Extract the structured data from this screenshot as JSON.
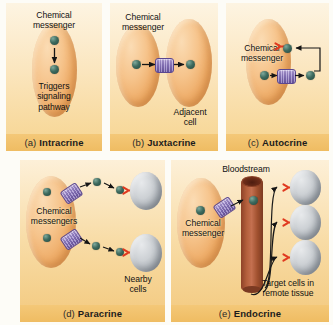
{
  "figure": {
    "colors": {
      "panel_bg_light": "#fdf4e2",
      "panel_bg_amber": "#f6d48f",
      "caption_band": "#f4c878",
      "cell_fill": "#f0b071",
      "target_cell_fill": "#b9bfc5",
      "messenger_dot": "#3e6b5f",
      "channel_purple": "#8e79c4",
      "receptor_red": "#e03a20",
      "vessel_red_brown": "#a1512f",
      "arrow_black": "#1a1a1a"
    }
  },
  "panels": [
    {
      "id": "intracrine",
      "letter": "(a)",
      "name": "Intracrine",
      "labels": {
        "messenger": "Chemical\nmessenger",
        "effect": "Triggers\nsignaling\npathway"
      },
      "elements": {
        "cells": 1,
        "messenger_dots": 2,
        "channels": 0,
        "receptors": 0,
        "arrows": 1
      }
    },
    {
      "id": "juxtacrine",
      "letter": "(b)",
      "name": "Juxtacrine",
      "labels": {
        "messenger": "Chemical\nmessenger",
        "adjacent": "Adjacent\ncell"
      },
      "elements": {
        "cells": 2,
        "messenger_dots": 2,
        "channels": 1,
        "receptors": 0,
        "arrows": 2
      }
    },
    {
      "id": "autocrine",
      "letter": "(c)",
      "name": "Autocrine",
      "labels": {
        "messenger": "Chemical\nmessenger"
      },
      "elements": {
        "cells": 1,
        "messenger_dots": 3,
        "channels": 1,
        "receptors": 1,
        "arrows": 3
      }
    },
    {
      "id": "paracrine",
      "letter": "(d)",
      "name": "Paracrine",
      "labels": {
        "messengers": "Chemical\nmessengers",
        "nearby": "Nearby\ncells"
      },
      "elements": {
        "cells": 1,
        "target_cells": 2,
        "messenger_dots": 6,
        "channels": 2,
        "receptors": 2,
        "arrows": 4
      }
    },
    {
      "id": "endocrine",
      "letter": "(e)",
      "name": "Endocrine",
      "labels": {
        "messenger": "Chemical\nmessenger",
        "bloodstream": "Bloodstream",
        "target": "Target cells in\nremote tissue"
      },
      "elements": {
        "cells": 1,
        "target_cells": 3,
        "messenger_dots": 2,
        "channels": 1,
        "receptors": 3,
        "arrows": 5,
        "vessel": 1
      }
    }
  ]
}
